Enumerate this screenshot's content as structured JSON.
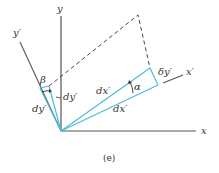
{
  "figure": {
    "caption": "(e)",
    "colors": {
      "axis": "#555555",
      "rotated": "#4dbbd9",
      "dashed": "#444444",
      "text": "#333333"
    },
    "labels": {
      "y": "y",
      "x": "x",
      "y_prime": "y′",
      "x_prime": "x′",
      "beta": "β",
      "alpha": "α",
      "dy_prime_inner": "dy′",
      "dy_prime_outer": "dy′",
      "dx_prime_upper": "dx′",
      "dx_prime_lower": "dx′",
      "delta_y_prime": "δy′"
    }
  }
}
